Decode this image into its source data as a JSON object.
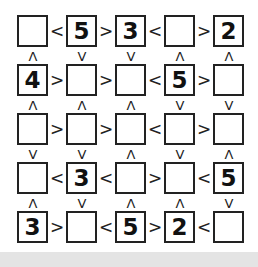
{
  "puzzle": {
    "type": "futoshiki",
    "size": 5,
    "rows": [
      {
        "cells": [
          "",
          "5",
          "3",
          "",
          "2"
        ],
        "h": [
          "<",
          ">",
          "<",
          ">"
        ]
      },
      {
        "cells": [
          "4",
          "",
          "",
          "5",
          ""
        ],
        "h": [
          ">",
          ">",
          "<",
          ">"
        ]
      },
      {
        "cells": [
          "",
          "",
          "",
          "",
          ""
        ],
        "h": [
          ">",
          ">",
          "<",
          ">"
        ]
      },
      {
        "cells": [
          "",
          "3",
          "",
          "",
          "5"
        ],
        "h": [
          "<",
          "<",
          ">",
          "<"
        ]
      },
      {
        "cells": [
          "3",
          "",
          "5",
          "2",
          ""
        ],
        "h": [
          ">",
          "<",
          ">",
          "<"
        ]
      }
    ],
    "vertical": [
      [
        "^",
        "v",
        "v",
        "^",
        "^"
      ],
      [
        "^",
        "^",
        "^",
        "v",
        "v"
      ],
      [
        "v",
        "v",
        "^",
        "v",
        "^"
      ],
      [
        "^",
        "v",
        "^",
        "^",
        "v"
      ]
    ]
  }
}
